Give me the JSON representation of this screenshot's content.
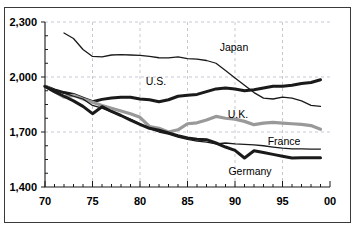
{
  "chart_data": {
    "type": "line",
    "title": "",
    "subtitle": "",
    "xlabel": "",
    "ylabel": "",
    "xlim": [
      70,
      100
    ],
    "ylim": [
      1400,
      2300
    ],
    "grid": true,
    "legend_position": "inline-labels",
    "y_ticks": [
      1400,
      1700,
      2000,
      2300
    ],
    "y_tick_labels": [
      "1,400",
      "1,700",
      "2,000",
      "2,300"
    ],
    "x_ticks": [
      70,
      75,
      80,
      85,
      90,
      95,
      100
    ],
    "x_tick_labels": [
      "70",
      "75",
      "80",
      "85",
      "90",
      "95",
      "00"
    ],
    "x_minor_tick_step": 1,
    "series": [
      {
        "name": "Japan",
        "label": "Japan",
        "color": "#1a1a1a",
        "width": 1.3,
        "label_x": 234,
        "label_y": 51,
        "x": [
          72,
          73,
          74,
          75,
          76,
          77,
          78,
          79,
          80,
          81,
          82,
          83,
          84,
          85,
          86,
          87,
          88,
          89,
          90,
          91,
          92,
          93,
          94,
          95,
          96,
          97,
          98,
          99
        ],
        "values": [
          2240,
          2210,
          2150,
          2112,
          2110,
          2120,
          2122,
          2120,
          2118,
          2112,
          2105,
          2104,
          2110,
          2100,
          2098,
          2090,
          2075,
          2035,
          1995,
          1955,
          1915,
          1885,
          1880,
          1890,
          1885,
          1870,
          1845,
          1840
        ]
      },
      {
        "name": "U.S.",
        "label": "U.S.",
        "color": "#1a1a1a",
        "width": 3.0,
        "label_x": 156,
        "label_y": 85,
        "x": [
          70,
          71,
          72,
          73,
          74,
          75,
          76,
          77,
          78,
          79,
          80,
          81,
          82,
          83,
          84,
          85,
          86,
          87,
          88,
          89,
          90,
          91,
          92,
          93,
          94,
          95,
          96,
          97,
          98,
          99
        ],
        "values": [
          1950,
          1930,
          1915,
          1905,
          1885,
          1865,
          1878,
          1885,
          1890,
          1890,
          1880,
          1876,
          1865,
          1876,
          1895,
          1900,
          1905,
          1920,
          1935,
          1940,
          1935,
          1925,
          1930,
          1940,
          1950,
          1950,
          1955,
          1965,
          1970,
          1985
        ]
      },
      {
        "name": "U.K.",
        "label": "U.K.",
        "color": "#999999",
        "width": 3.2,
        "label_x": 238,
        "label_y": 118,
        "x": [
          70,
          71,
          72,
          73,
          74,
          75,
          76,
          77,
          78,
          79,
          80,
          81,
          82,
          83,
          84,
          85,
          86,
          87,
          88,
          89,
          90,
          91,
          92,
          93,
          94,
          95,
          96,
          97,
          98,
          99
        ],
        "values": [
          1950,
          1920,
          1890,
          1900,
          1880,
          1862,
          1845,
          1830,
          1815,
          1800,
          1780,
          1730,
          1720,
          1700,
          1712,
          1745,
          1750,
          1765,
          1785,
          1775,
          1770,
          1758,
          1740,
          1748,
          1752,
          1748,
          1745,
          1742,
          1735,
          1715
        ]
      },
      {
        "name": "France",
        "label": "France",
        "color": "#1a1a1a",
        "width": 1.3,
        "label_x": 284,
        "label_y": 145,
        "x": [
          70,
          71,
          72,
          73,
          74,
          75,
          76,
          77,
          78,
          79,
          80,
          81,
          82,
          83,
          84,
          85,
          86,
          87,
          88,
          89,
          90,
          91,
          92,
          93,
          94,
          95,
          96,
          97,
          98,
          99
        ],
        "values": [
          1950,
          1930,
          1912,
          1895,
          1880,
          1845,
          1830,
          1810,
          1790,
          1770,
          1745,
          1718,
          1700,
          1688,
          1672,
          1660,
          1650,
          1645,
          1635,
          1640,
          1635,
          1632,
          1630,
          1625,
          1618,
          1612,
          1608,
          1608,
          1607,
          1607
        ]
      },
      {
        "name": "Germany",
        "label": "Germany",
        "color": "#1a1a1a",
        "width": 3.0,
        "label_x": 250,
        "label_y": 175,
        "x": [
          70,
          71,
          72,
          73,
          74,
          75,
          76,
          77,
          78,
          79,
          80,
          81,
          82,
          83,
          84,
          85,
          86,
          87,
          88,
          89,
          90,
          91,
          92,
          93,
          94,
          95,
          96,
          97,
          98,
          99
        ],
        "values": [
          1948,
          1920,
          1895,
          1870,
          1840,
          1800,
          1838,
          1812,
          1790,
          1765,
          1742,
          1720,
          1710,
          1695,
          1680,
          1668,
          1660,
          1658,
          1640,
          1618,
          1600,
          1558,
          1598,
          1588,
          1578,
          1568,
          1558,
          1560,
          1560,
          1560
        ]
      }
    ]
  }
}
